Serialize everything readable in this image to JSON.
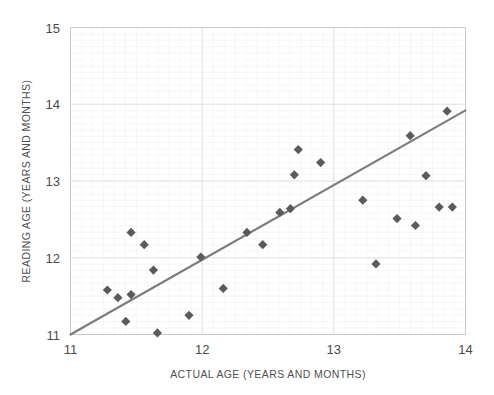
{
  "chart_data": {
    "type": "scatter",
    "title": "",
    "xlabel": "ACTUAL AGE (YEARS AND MONTHS)",
    "ylabel": "READING AGE (YEARS AND MONTHS)",
    "xlim": [
      11,
      14
    ],
    "ylim": [
      11,
      15
    ],
    "xticks": [
      11,
      12,
      13,
      14
    ],
    "yticks": [
      11,
      12,
      13,
      14,
      15
    ],
    "xtick_labels": [
      "11",
      "12",
      "13",
      "14"
    ],
    "ytick_labels": [
      "11",
      "12",
      "13",
      "14",
      "15"
    ],
    "grid": "major and minor gridlines visible",
    "legend": "none",
    "marker_shape": "diamond",
    "marker_color": "#5b5b5b",
    "trendline": {
      "visible": true,
      "color": "#7c7c7c",
      "x": [
        11.0,
        14.0
      ],
      "y": [
        11.0,
        13.92
      ]
    },
    "points": [
      {
        "x": 11.28,
        "y": 11.58
      },
      {
        "x": 11.36,
        "y": 11.48
      },
      {
        "x": 11.46,
        "y": 12.33
      },
      {
        "x": 11.46,
        "y": 11.52
      },
      {
        "x": 11.42,
        "y": 11.17
      },
      {
        "x": 11.56,
        "y": 12.17
      },
      {
        "x": 11.63,
        "y": 11.84
      },
      {
        "x": 11.66,
        "y": 11.02
      },
      {
        "x": 11.9,
        "y": 11.25
      },
      {
        "x": 11.99,
        "y": 12.01
      },
      {
        "x": 12.16,
        "y": 11.6
      },
      {
        "x": 12.34,
        "y": 12.33
      },
      {
        "x": 12.46,
        "y": 12.17
      },
      {
        "x": 12.59,
        "y": 12.59
      },
      {
        "x": 12.67,
        "y": 12.64
      },
      {
        "x": 12.7,
        "y": 13.08
      },
      {
        "x": 12.73,
        "y": 13.41
      },
      {
        "x": 12.9,
        "y": 13.24
      },
      {
        "x": 13.22,
        "y": 12.75
      },
      {
        "x": 13.32,
        "y": 11.92
      },
      {
        "x": 13.48,
        "y": 12.51
      },
      {
        "x": 13.58,
        "y": 13.59
      },
      {
        "x": 13.62,
        "y": 12.42
      },
      {
        "x": 13.7,
        "y": 13.07
      },
      {
        "x": 13.8,
        "y": 12.66
      },
      {
        "x": 13.86,
        "y": 13.91
      },
      {
        "x": 13.9,
        "y": 12.66
      }
    ]
  }
}
